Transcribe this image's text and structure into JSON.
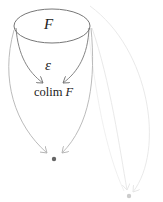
{
  "diagram": {
    "type": "commutative-diagram",
    "nodes": {
      "functor": {
        "label": "F",
        "shape": "ellipse"
      },
      "cocone": {
        "label": "ε"
      },
      "colimit": {
        "prefix": "colim",
        "functor": "F"
      },
      "dot_dark": {
        "label": "",
        "shape": "dot",
        "color": "#666666"
      },
      "dot_light": {
        "label": "",
        "shape": "dot",
        "color": "#cccccc"
      }
    },
    "edges": [
      {
        "from": "functor-left",
        "to": "colimit",
        "color": "#777777"
      },
      {
        "from": "functor-right",
        "to": "colimit",
        "color": "#777777"
      },
      {
        "from": "functor-left",
        "to": "dot_dark",
        "color": "#b3b3b3"
      },
      {
        "from": "functor-right",
        "to": "dot_dark",
        "color": "#b3b3b3"
      },
      {
        "from": "functor-right",
        "to": "dot_light",
        "color": "#e6e6e6"
      },
      {
        "from": "functor-top",
        "to": "dot_light",
        "color": "#e6e6e6"
      }
    ],
    "colors": {
      "ink": "#222222",
      "strong": "#777777",
      "medium": "#b3b3b3",
      "faint": "#e6e6e6"
    }
  }
}
